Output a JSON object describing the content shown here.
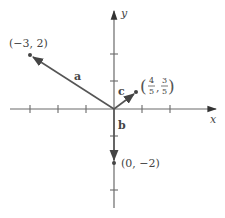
{
  "diagram": {
    "type": "vector-plot",
    "axes": {
      "x_label": "x",
      "y_label": "y",
      "unit_px": 27.5,
      "origin_px": [
        114,
        109
      ]
    },
    "vectors": [
      {
        "name": "a",
        "label": "a",
        "from": [
          0,
          0
        ],
        "to": [
          -3,
          2
        ],
        "point_label": "(−3, 2)"
      },
      {
        "name": "b",
        "label": "b",
        "from": [
          0,
          0
        ],
        "to": [
          0,
          -2
        ],
        "point_label": "(0, −2)"
      },
      {
        "name": "c",
        "label": "c",
        "from": [
          0,
          0
        ],
        "to": [
          0.8,
          0.6
        ],
        "point_label_parts": {
          "x_num": "4",
          "x_den": "5",
          "y_num": "3",
          "y_den": "5",
          "open": "(",
          "close": ")",
          "sep": ","
        }
      }
    ],
    "colors": {
      "axis": "#6a6a6a",
      "vector": "#555555",
      "text": "#444444"
    }
  }
}
